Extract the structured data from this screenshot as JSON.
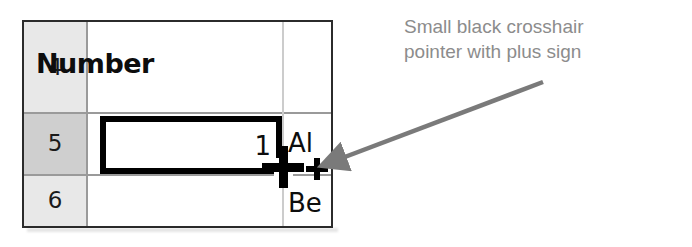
{
  "spreadsheet": {
    "row_headers": [
      "4",
      "5",
      "6"
    ],
    "selected_row": "5",
    "header_cell_label": "Number",
    "selected_cell_value": "1",
    "neighbor_column": {
      "row5_text": "Al",
      "row6_text": "Be"
    },
    "colors": {
      "row_header_bg": "#e8e8e8",
      "row_header_selected_bg": "#cfcfcf",
      "grid_line": "#9a9a9a",
      "outer_border": "#2b2b2b",
      "selection_border": "#000000",
      "cell_bg": "#ffffff",
      "text": "#0d0d0d"
    }
  },
  "cursor": {
    "name": "crosshair-with-plus",
    "color": "#000000"
  },
  "annotation": {
    "line1": "Small black crosshair",
    "line2": "pointer with plus sign",
    "color": "#8c8c8c",
    "arrow_color": "#7a7a7a"
  }
}
